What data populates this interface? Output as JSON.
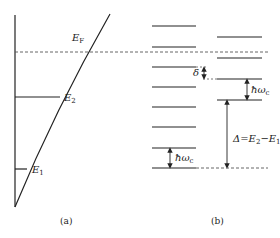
{
  "panel_a": {
    "caption": "(a)",
    "fermi_label": "E",
    "fermi_sub": "F",
    "e2_label": "E",
    "e2_sub": "2",
    "e1_label": "E",
    "e1_sub": "1"
  },
  "panel_b": {
    "caption": "(b)",
    "delta_label": "δ",
    "hw_label_right": "ħω",
    "hw_sub_right": "c",
    "hw_label_left": "ħω",
    "hw_sub_left": "c",
    "gap_label": "Δ=E",
    "gap_sub1": "2",
    "gap_minus": "−E",
    "gap_sub2": "1",
    "left_levels_y": [
      26,
      47,
      67,
      87,
      107,
      127,
      148,
      168
    ],
    "right_levels_y": [
      37,
      58,
      79,
      100
    ]
  },
  "colors": {
    "line": "#222222",
    "dashed": "#555555"
  }
}
